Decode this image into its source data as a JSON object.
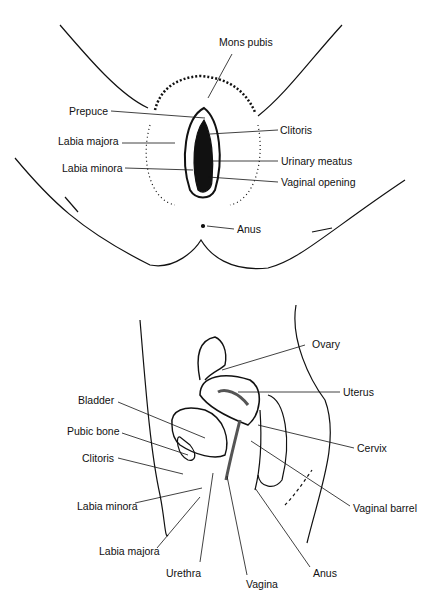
{
  "diagram": {
    "type": "anatomical-illustration",
    "panels": [
      {
        "id": "external-view",
        "labels": [
          {
            "text": "Mons pubis",
            "x": 219,
            "y": 36
          },
          {
            "text": "Prepuce",
            "x": 69,
            "y": 105
          },
          {
            "text": "Clitoris",
            "x": 280,
            "y": 124
          },
          {
            "text": "Labia majora",
            "x": 58,
            "y": 135
          },
          {
            "text": "Urinary  meatus",
            "x": 281,
            "y": 155
          },
          {
            "text": "Labia minora",
            "x": 62,
            "y": 162
          },
          {
            "text": "Vaginal opening",
            "x": 281,
            "y": 176
          },
          {
            "text": "Anus",
            "x": 237,
            "y": 223
          }
        ]
      },
      {
        "id": "sagittal-section",
        "labels": [
          {
            "text": "Ovary",
            "x": 312,
            "y": 338
          },
          {
            "text": "Uterus",
            "x": 343,
            "y": 386
          },
          {
            "text": "Bladder",
            "x": 78,
            "y": 394
          },
          {
            "text": "Pubic bone",
            "x": 67,
            "y": 425
          },
          {
            "text": "Cervix",
            "x": 357,
            "y": 442
          },
          {
            "text": "Clitoris",
            "x": 82,
            "y": 452
          },
          {
            "text": "Vaginal barrel",
            "x": 353,
            "y": 502
          },
          {
            "text": "Labia minora",
            "x": 77,
            "y": 500
          },
          {
            "text": "Labia majora",
            "x": 99,
            "y": 545
          },
          {
            "text": "Urethra",
            "x": 166,
            "y": 567
          },
          {
            "text": "Vagina",
            "x": 246,
            "y": 578
          },
          {
            "text": "Anus",
            "x": 313,
            "y": 567
          }
        ]
      }
    ]
  }
}
